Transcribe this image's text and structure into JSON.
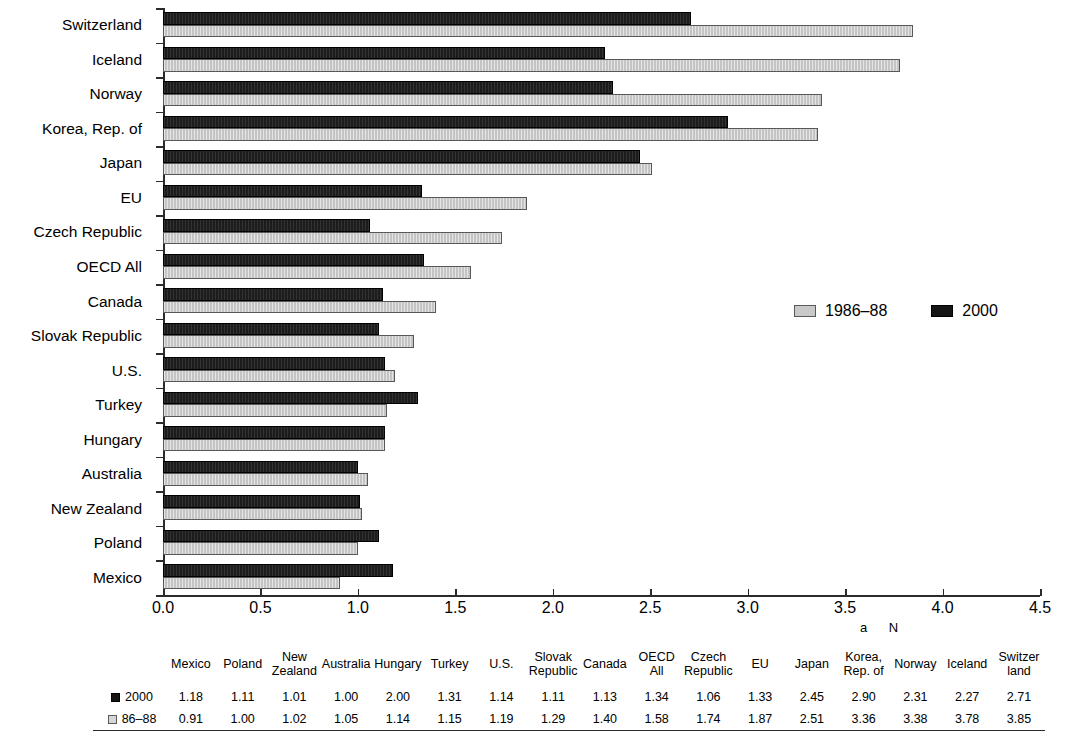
{
  "chart_data": {
    "type": "bar",
    "orientation": "horizontal",
    "title": "",
    "xlabel": "",
    "ylabel": "",
    "xlim": [
      0,
      4.5
    ],
    "xticks": [
      "0.0",
      "0.5",
      "1.0",
      "1.5",
      "2.0",
      "2.5",
      "3.0",
      "3.5",
      "4.0",
      "4.5"
    ],
    "grid": false,
    "legend_position": "center-right",
    "categories": [
      "Switzerland",
      "Iceland",
      "Norway",
      "Korea, Rep. of",
      "Japan",
      "EU",
      "Czech Republic",
      "OECD All",
      "Canada",
      "Slovak Republic",
      "U.S.",
      "Turkey",
      "Hungary",
      "Australia",
      "New Zealand",
      "Poland",
      "Mexico"
    ],
    "series": [
      {
        "name": "1986–88",
        "color": "#c4c4c4",
        "values": [
          3.85,
          3.78,
          3.38,
          3.36,
          2.51,
          1.87,
          1.74,
          1.58,
          1.4,
          1.29,
          1.19,
          1.15,
          1.14,
          1.05,
          1.02,
          1.0,
          0.91
        ]
      },
      {
        "name": "2000",
        "color": "#1c1c1c",
        "values": [
          2.71,
          2.27,
          2.31,
          2.9,
          2.45,
          1.33,
          1.06,
          1.34,
          1.13,
          1.11,
          1.14,
          1.31,
          1.14,
          1.0,
          1.01,
          1.11,
          1.18
        ]
      }
    ]
  },
  "legend": {
    "items": [
      {
        "label": "1986–88",
        "swatch": "gray"
      },
      {
        "label": "2000",
        "swatch": "black"
      }
    ]
  },
  "footnote_marks": [
    "a",
    "N"
  ],
  "table": {
    "row_labels": [
      "2000",
      "86–88"
    ],
    "columns": [
      "Mexico",
      "Poland",
      "New Zealand",
      "Australia",
      "Hungary",
      "Turkey",
      "U.S.",
      "Slovak Republic",
      "Canada",
      "OECD All",
      "Czech Republic",
      "EU",
      "Japan",
      "Korea, Rep. of",
      "Norway",
      "Iceland",
      "Switzer land"
    ],
    "rows": [
      {
        "label": "2000",
        "swatch": "black",
        "values": [
          "1.18",
          "1.11",
          "1.01",
          "1.00",
          "2.00",
          "1.31",
          "1.14",
          "1.11",
          "1.13",
          "1.34",
          "1.06",
          "1.33",
          "2.45",
          "2.90",
          "2.31",
          "2.27",
          "2.71"
        ]
      },
      {
        "label": "86–88",
        "swatch": "gray",
        "values": [
          "0.91",
          "1.00",
          "1.02",
          "1.05",
          "1.14",
          "1.15",
          "1.19",
          "1.29",
          "1.40",
          "1.58",
          "1.74",
          "1.87",
          "2.51",
          "3.36",
          "3.38",
          "3.78",
          "3.85"
        ]
      }
    ]
  }
}
